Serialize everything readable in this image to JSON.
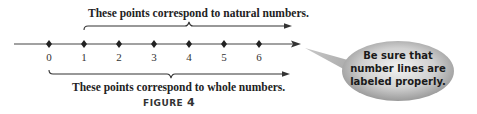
{
  "figure": {
    "label_word": "FIGURE",
    "label_number": "4"
  },
  "number_line": {
    "ticks": [
      "0",
      "1",
      "2",
      "3",
      "4",
      "5",
      "6"
    ],
    "direction_arrow": "right"
  },
  "annotations": {
    "top_brace_text": "These points correspond to natural numbers.",
    "bottom_brace_text": "These points correspond to whole numbers."
  },
  "callout": {
    "line1": "Be sure that",
    "line2": "number lines are",
    "line3": "labeled properly."
  },
  "colors": {
    "line": "#333333",
    "bubble_light": "#e4e4e4",
    "bubble_dark": "#8a8a8a"
  }
}
